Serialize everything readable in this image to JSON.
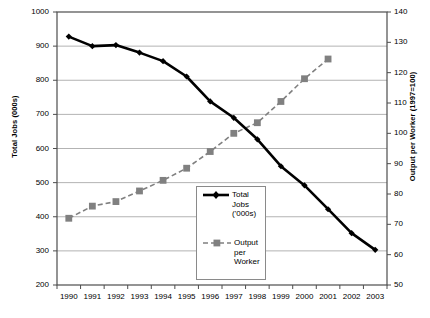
{
  "chart_data": {
    "type": "line",
    "title": "",
    "xlabel": "",
    "ylabel": "Total Jobs (000s)",
    "y2label": "Output per Worker (1997=100)",
    "grid": true,
    "legend_position": "inside-center",
    "categories": [
      "1990",
      "1991",
      "1992",
      "1993",
      "1994",
      "1995",
      "1996",
      "1997",
      "1998",
      "1999",
      "2000",
      "2001",
      "2002",
      "2003"
    ],
    "ylim": [
      200,
      1000
    ],
    "yticks": [
      200,
      300,
      400,
      500,
      600,
      700,
      800,
      900,
      1000
    ],
    "y2lim": [
      50,
      140
    ],
    "y2ticks": [
      50,
      60,
      70,
      80,
      90,
      100,
      110,
      120,
      130,
      140
    ],
    "series": [
      {
        "name": "Total Jobs ('000s)",
        "axis": "left",
        "color": "#000000",
        "marker": "diamond",
        "line_style": "solid",
        "values": [
          928,
          900,
          903,
          881,
          856,
          811,
          738,
          690,
          627,
          548,
          492,
          422,
          352,
          303
        ]
      },
      {
        "name": "Output per Worker",
        "axis": "right",
        "color": "#808080",
        "marker": "square",
        "line_style": "dashed",
        "values": [
          72,
          76,
          77.5,
          81,
          84.5,
          88.5,
          94,
          100,
          103.5,
          110.5,
          118,
          124.5,
          null,
          null
        ]
      }
    ]
  },
  "axes": {
    "left": {
      "title": "Total Jobs (000s)",
      "labels": [
        "1000",
        "900",
        "800",
        "700",
        "600",
        "500",
        "400",
        "300",
        "200"
      ]
    },
    "right": {
      "title": "Output per Worker (1997=100)",
      "labels": [
        "140",
        "130",
        "120",
        "110",
        "100",
        "90",
        "80",
        "70",
        "60",
        "50"
      ]
    },
    "bottom": {
      "labels": [
        "1990",
        "1991",
        "1992",
        "1993",
        "1994",
        "1995",
        "1996",
        "1997",
        "1998",
        "1999",
        "2000",
        "2001",
        "2002",
        "2003"
      ]
    }
  },
  "legend": {
    "entries": [
      {
        "label": "Total\nJobs\n('000s)",
        "marker": "diamond-solid-line",
        "color": "#000000"
      },
      {
        "label": "Output\nper\nWorker",
        "marker": "square-dashed-line",
        "color": "#808080"
      }
    ]
  },
  "colors": {
    "series_jobs": "#000000",
    "series_output": "#808080",
    "gridline": "#b3b3b3",
    "axis": "#4d4d4d",
    "background": "#ffffff"
  }
}
